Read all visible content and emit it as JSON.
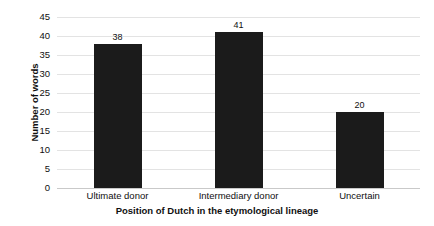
{
  "chart_data": {
    "type": "bar",
    "title": "",
    "subtitle": "",
    "categories": [
      "Ultimate donor",
      "Intermediary donor",
      "Uncertain"
    ],
    "values": [
      38,
      41,
      20
    ],
    "data_labels": [
      "38",
      "41",
      "20"
    ],
    "xlabel": "Position of Dutch in the etymological lineage",
    "ylabel": "Number of words",
    "ylim": [
      0,
      45
    ],
    "ytick_step": 5,
    "ytick_labels": [
      "45",
      "40",
      "35",
      "30",
      "25",
      "20",
      "15",
      "10",
      "5",
      "0"
    ],
    "ytick_values": [
      45,
      40,
      35,
      30,
      25,
      20,
      15,
      10,
      5,
      0
    ],
    "grid": true,
    "grid_axis": "y",
    "legend": false,
    "legend_position": "none",
    "series": [
      {
        "name": "Number of words",
        "values": [
          38,
          41,
          20
        ],
        "color": "#1b1b1b"
      }
    ],
    "colors": {
      "bar": "#1b1b1b",
      "gridline": "#e3e3e3",
      "axis_line": "#c9c9c9",
      "text": "#101010",
      "background": "#ffffff"
    }
  }
}
